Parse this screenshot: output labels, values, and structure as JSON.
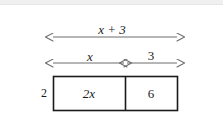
{
  "diagram": {
    "type": "area-model",
    "colors": {
      "stroke": "#1b1b1b",
      "arrow": "#6d6d6d",
      "background": "#ffffff",
      "top_strip": "#f0f0f0"
    },
    "total_width_label": "x + 3",
    "segment_labels": {
      "left": "x",
      "right": "3"
    },
    "height_label": "2",
    "cells": [
      {
        "label": "2x",
        "position": "left"
      },
      {
        "label": "6",
        "position": "right"
      }
    ],
    "arrows": {
      "total": {
        "text": "x + 3",
        "double_headed": true
      },
      "part_left": {
        "text": "x",
        "double_headed": true
      },
      "part_right": {
        "text": "3",
        "double_headed": true
      }
    },
    "expression": {
      "factored": "2(x + 3)",
      "expanded": "2x + 6"
    }
  }
}
